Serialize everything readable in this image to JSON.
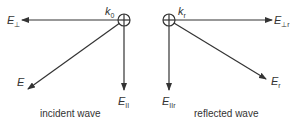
{
  "diagram": {
    "left": {
      "caption": "incident wave",
      "k_label": {
        "main": "k",
        "sub": "0"
      },
      "e_perp": {
        "main": "E",
        "sub": "⊥"
      },
      "e": {
        "main": "E",
        "sub": ""
      },
      "e_par": {
        "main": "E",
        "sub": "II"
      }
    },
    "right": {
      "caption": "reflected wave",
      "k_label": {
        "main": "k",
        "sub": "r"
      },
      "e_perp": {
        "main": "E",
        "sub": "⊥r"
      },
      "e": {
        "main": "E",
        "sub": "r"
      },
      "e_par": {
        "main": "E",
        "sub": "IIr"
      }
    },
    "colors": {
      "stroke": "#333333",
      "text": "#333333"
    }
  }
}
